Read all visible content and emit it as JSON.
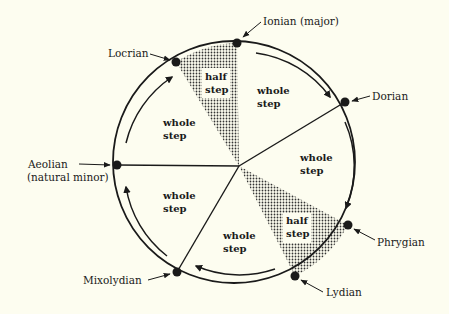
{
  "diagram": {
    "type": "circle-of-modes",
    "background": "#fdfdf0",
    "ink": "#1a1a1a",
    "center": [
      239,
      166
    ],
    "modes": [
      {
        "id": "ionian",
        "label": "Ionian (major)",
        "node": [
          237,
          43
        ]
      },
      {
        "id": "dorian",
        "label": "Dorian",
        "node": [
          345,
          102
        ]
      },
      {
        "id": "phrygian",
        "label": "Phrygian",
        "node": [
          348,
          225
        ]
      },
      {
        "id": "lydian",
        "label": "Lydian",
        "node": [
          295,
          276
        ]
      },
      {
        "id": "mixolydian",
        "label": "Mixolydian",
        "node": [
          177,
          272
        ]
      },
      {
        "id": "aeolian",
        "label_line1": "Aeolian",
        "label_line2": "(natural minor)",
        "node": [
          117,
          165
        ]
      },
      {
        "id": "locrian",
        "label": "Locrian",
        "node": [
          176,
          62
        ]
      }
    ],
    "intervals": [
      {
        "from": "locrian",
        "to": "ionian",
        "line1": "half",
        "line2": "step",
        "shaded": true
      },
      {
        "from": "ionian",
        "to": "dorian",
        "line1": "whole",
        "line2": "step",
        "shaded": false
      },
      {
        "from": "dorian",
        "to": "phrygian",
        "line1": "whole",
        "line2": "step",
        "shaded": false
      },
      {
        "from": "phrygian",
        "to": "lydian",
        "line1": "half",
        "line2": "step",
        "shaded": true
      },
      {
        "from": "lydian",
        "to": "mixolydian",
        "line1": "whole",
        "line2": "step",
        "shaded": false
      },
      {
        "from": "mixolydian",
        "to": "aeolian",
        "line1": "whole",
        "line2": "step",
        "shaded": false
      },
      {
        "from": "aeolian",
        "to": "locrian",
        "line1": "whole",
        "line2": "step",
        "shaded": false
      }
    ]
  }
}
